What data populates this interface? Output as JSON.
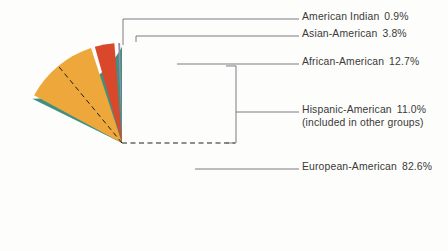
{
  "chart_data": {
    "type": "pie",
    "title": "",
    "subtitle": "",
    "xlabel": "",
    "ylabel": "",
    "legend_position": "right-callouts",
    "grid": false,
    "units": "percent",
    "start_angle_deg": 0,
    "direction": "counterclockwise",
    "categories": [
      "American Indian",
      "Asian-American",
      "African-American",
      "Hispanic-American",
      "European-American"
    ],
    "values": [
      0.9,
      3.8,
      12.7,
      11.0,
      82.6
    ],
    "slices": [
      {
        "label": "American Indian",
        "value": 0.9,
        "value_text": "0.9%",
        "color": "#9b8aa8",
        "drawn": true,
        "note": ""
      },
      {
        "label": "Asian-American",
        "value": 3.8,
        "value_text": "3.8%",
        "color": "#d9482a",
        "drawn": true,
        "note": ""
      },
      {
        "label": "African-American",
        "value": 12.7,
        "value_text": "12.7%",
        "color": "#eda73a",
        "drawn": true,
        "note": ""
      },
      {
        "label": "Hispanic-American",
        "value": 11.0,
        "value_text": "11.0%",
        "color": "none",
        "drawn": false,
        "note": "(included in other groups)"
      },
      {
        "label": "European-American",
        "value": 82.6,
        "value_text": "82.6%",
        "color": "#3f9083",
        "drawn": true,
        "note": ""
      }
    ],
    "annotations": [
      "Hispanic-American 11.0% (included in other groups)"
    ]
  },
  "labels": {
    "american_indian": {
      "name": "American Indian",
      "pct": "0.9%"
    },
    "asian_american": {
      "name": "Asian-American",
      "pct": "3.8%"
    },
    "african_american": {
      "name": "African-American",
      "pct": "12.7%"
    },
    "hispanic_american": {
      "name": "Hispanic-American",
      "pct": "11.0%",
      "note": "(included in other groups)"
    },
    "european_american": {
      "name": "European-American",
      "pct": "82.6%"
    }
  },
  "colors": {
    "green": "#3f9083",
    "orange": "#eda73a",
    "red": "#d9482a",
    "violet": "#9b8aa8",
    "leader_line": "#6e6e78",
    "dashed_line": "#1e1e1e",
    "background": "#fdfdfb",
    "text": "#3a3a3a",
    "slice_gap": "#ffffff"
  }
}
